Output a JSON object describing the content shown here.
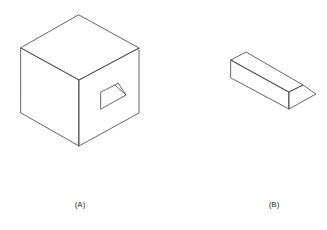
{
  "figures": [
    {
      "id": "A",
      "label": "(A)",
      "description": "Isometric cube with a trapezoidal window cut into its right face",
      "label_pos": {
        "x": 80,
        "y": 200
      }
    },
    {
      "id": "B",
      "label": "(B)",
      "description": "Isometric rectangular bar with a chamfered right end",
      "label_pos": {
        "x": 274,
        "y": 200
      }
    }
  ],
  "colors": {
    "background": "#ffffff",
    "line": "#555555",
    "text": "#333333"
  }
}
